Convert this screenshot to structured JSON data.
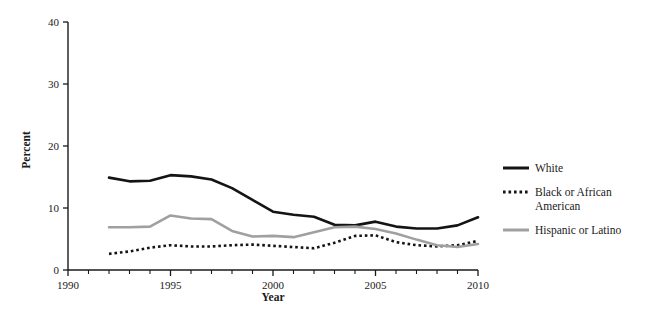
{
  "chart_data": {
    "type": "line",
    "title": "",
    "xlabel": "Year",
    "ylabel": "Percent",
    "xlim": [
      1990,
      2010
    ],
    "ylim": [
      0,
      40
    ],
    "grid": false,
    "legend_position": "right",
    "y_ticks": [
      "0",
      "10",
      "20",
      "30",
      "40"
    ],
    "y_tick_values": [
      0,
      10,
      20,
      30,
      40
    ],
    "x_ticks": [
      "1990",
      "1995",
      "2000",
      "2005",
      "2010"
    ],
    "x_tick_values": [
      1990,
      1995,
      2000,
      2005,
      2010
    ],
    "x_minor_interval": 1,
    "x": [
      1992,
      1993,
      1994,
      1995,
      1996,
      1997,
      1998,
      1999,
      2000,
      2001,
      2002,
      2003,
      2004,
      2005,
      2006,
      2007,
      2008,
      2009,
      2010
    ],
    "series": [
      {
        "name": "White",
        "style": "solid",
        "color": "#141414",
        "width": 2.6,
        "values": [
          14.9,
          14.3,
          14.4,
          15.3,
          15.1,
          14.6,
          13.2,
          11.3,
          9.4,
          8.9,
          8.6,
          7.3,
          7.2,
          7.8,
          7.0,
          6.7,
          6.7,
          7.2,
          8.5
        ]
      },
      {
        "name": "Black or African American",
        "style": "dotted",
        "color": "#141414",
        "width": 2.6,
        "values": [
          2.6,
          3.0,
          3.6,
          4.0,
          3.8,
          3.8,
          4.0,
          4.1,
          3.9,
          3.7,
          3.5,
          4.4,
          5.5,
          5.6,
          4.5,
          4.0,
          3.8,
          4.0,
          4.7
        ]
      },
      {
        "name": "Hispanic or Latino",
        "style": "solid",
        "color": "#a0a0a0",
        "width": 2.6,
        "values": [
          6.9,
          6.9,
          7.0,
          8.8,
          8.3,
          8.2,
          6.3,
          5.4,
          5.5,
          5.3,
          6.1,
          6.9,
          7.0,
          6.6,
          5.9,
          4.9,
          4.0,
          3.7,
          4.2
        ]
      }
    ]
  },
  "legend": {
    "items": [
      {
        "label": "White",
        "style": "solid",
        "color": "#141414"
      },
      {
        "label": "Black or African",
        "label2": "American",
        "style": "dotted",
        "color": "#141414"
      },
      {
        "label": "Hispanic or Latino",
        "style": "solid",
        "color": "#a0a0a0"
      }
    ]
  },
  "axes": {
    "x_title": "Year",
    "y_title": "Percent"
  }
}
